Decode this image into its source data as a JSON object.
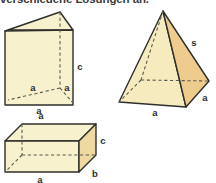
{
  "caption": {
    "text": "verschiedene Lösungen an."
  },
  "colors": {
    "face_light": "#F8F1CE",
    "face_mid": "#F3E2AC",
    "face_dark": "#EDCC8D",
    "outline": "#2E2E2B",
    "dashed": "#5B5B55",
    "label": "#2E2E2B",
    "background": "#FFFFFF"
  },
  "figures": [
    {
      "name": "triangular-prism",
      "labels": {
        "depth_left": "a",
        "depth_right": "a",
        "height": "c",
        "base": "a"
      }
    },
    {
      "name": "square-pyramid",
      "labels": {
        "slant": "s",
        "base_front": "a",
        "base_right": "a"
      }
    },
    {
      "name": "rectangular-box",
      "labels": {
        "height": "c",
        "depth": "b",
        "width": "a"
      }
    }
  ]
}
